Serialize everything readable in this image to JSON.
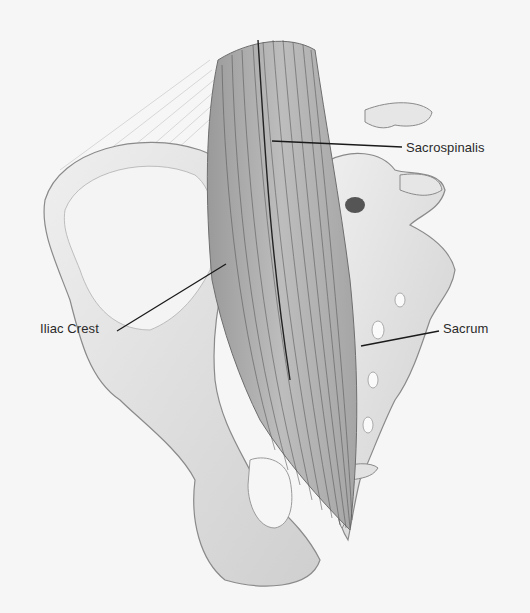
{
  "figure": {
    "background": "#f6f6f6",
    "labels": [
      {
        "text": "Sacrospinalis",
        "x": 406,
        "y": 141,
        "line": [
          [
            272,
            141
          ],
          [
            402,
            147
          ]
        ]
      },
      {
        "text": "Iliac Crest",
        "x": 40,
        "y": 322,
        "line": [
          [
            117,
            331
          ],
          [
            226,
            264
          ]
        ]
      },
      {
        "text": "Sacrum",
        "x": 443,
        "y": 322,
        "line": [
          [
            361,
            346
          ],
          [
            439,
            331
          ]
        ]
      }
    ]
  }
}
